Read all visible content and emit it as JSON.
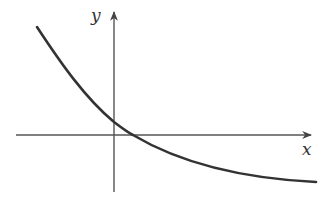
{
  "diagram": {
    "type": "function-graph",
    "axes": {
      "x_label": "x",
      "y_label": "y",
      "origin_px": [
        114,
        135
      ]
    },
    "curve": {
      "shape": "decreasing, concave up, approaching horizontal asymptote below x-axis",
      "path": "M37,27 C60,62 85,98 114,122 C122,128 127,132 133,135 C175,160 235,178 316,182",
      "y_intercept": "positive",
      "x_intercept": "positive"
    },
    "colors": {
      "axis": "#555555",
      "curve": "#333333",
      "background": "#ffffff"
    }
  }
}
